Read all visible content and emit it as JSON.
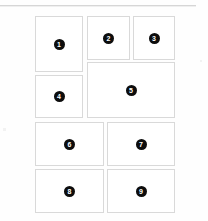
{
  "page": {
    "background_color": "#fefefe",
    "divider_color": "#d6d6d6",
    "card_border_color": "#d9d9d9",
    "card_fill_color": "#ffffff",
    "badge_color": "#0d0d0d",
    "badge_text_color": "#ffffff"
  },
  "grid": {
    "card_count": 9,
    "cards": [
      {
        "id": "card-1",
        "badge": "1"
      },
      {
        "id": "card-2",
        "badge": "2"
      },
      {
        "id": "card-3",
        "badge": "3"
      },
      {
        "id": "card-4",
        "badge": "4"
      },
      {
        "id": "card-5",
        "badge": "5"
      },
      {
        "id": "card-6",
        "badge": "6"
      },
      {
        "id": "card-7",
        "badge": "7"
      },
      {
        "id": "card-8",
        "badge": "8"
      },
      {
        "id": "card-9",
        "badge": "9"
      }
    ]
  }
}
